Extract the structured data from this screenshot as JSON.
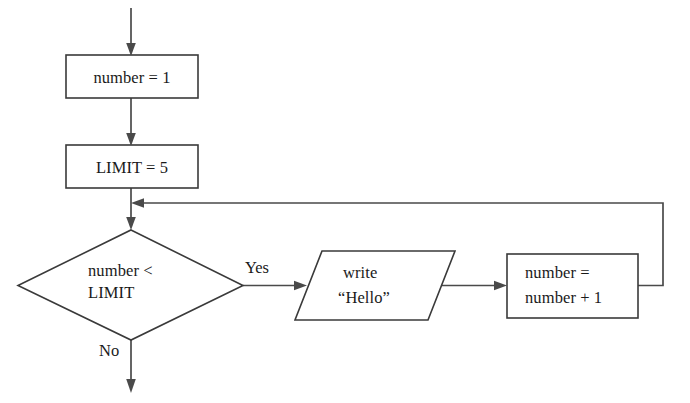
{
  "diagram": {
    "type": "flowchart",
    "line_color": "#4a4a4a",
    "shape_fill": "#ffffff",
    "text_color": "#1a1a1a",
    "background": "#ffffff",
    "nodes": {
      "init_number": {
        "shape": "process",
        "label": "number = 1"
      },
      "init_limit": {
        "shape": "process",
        "label": "LIMIT = 5"
      },
      "condition": {
        "shape": "decision",
        "line1": "number <",
        "line2": "LIMIT"
      },
      "output": {
        "shape": "io-parallelogram",
        "line1": "write",
        "line2": "“Hello”"
      },
      "increment": {
        "shape": "process",
        "line1": "number =",
        "line2": "number + 1"
      }
    },
    "edges": {
      "yes_label": "Yes",
      "no_label": "No"
    }
  }
}
